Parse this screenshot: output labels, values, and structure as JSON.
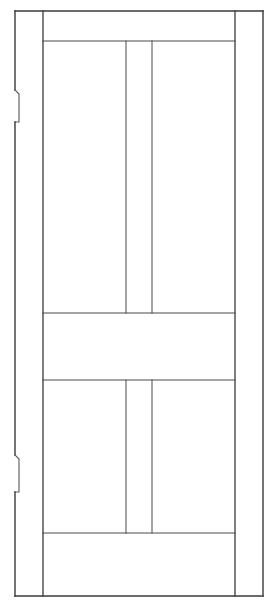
{
  "drawing": {
    "type": "door-elevation",
    "title": "Four Panel Door Elevation",
    "canvas": {
      "width": 276,
      "height": 608,
      "background": "#ffffff"
    },
    "style": {
      "line_color": "#3a3a3a",
      "line_color_light": "#5a5a5a",
      "outline_width": 1.4,
      "inner_width": 1.1,
      "muntin_width": 1.0
    },
    "geometry": {
      "outline": {
        "left": 15,
        "top": 11,
        "right": 263,
        "bottom": 596
      },
      "stiles": {
        "left_inner_x": 43,
        "right_inner_x": 235
      },
      "rails": {
        "top_rail_bottom_y": 41,
        "mid_rail_top_y": 313,
        "mid_rail_bottom_y": 380,
        "bottom_rail_top_y": 533
      },
      "muntins": {
        "x1": 126,
        "x2": 152
      },
      "hinge_notches": [
        {
          "name": "upper-hinge-mortise",
          "top_y": 90,
          "bottom_y": 122,
          "depth_x": 10,
          "inner_x": 19
        },
        {
          "name": "lower-hinge-mortise",
          "top_y": 455,
          "bottom_y": 492,
          "depth_x": 10,
          "inner_x": 19
        }
      ]
    },
    "panels": [
      {
        "name": "upper-left-panel",
        "x": 43,
        "y": 41,
        "width": 83,
        "height": 272
      },
      {
        "name": "upper-center-panel",
        "x": 126,
        "y": 41,
        "width": 26,
        "height": 272
      },
      {
        "name": "upper-right-panel",
        "x": 152,
        "y": 41,
        "width": 83,
        "height": 272
      },
      {
        "name": "middle-rail-panel",
        "x": 43,
        "y": 313,
        "width": 192,
        "height": 67
      },
      {
        "name": "lower-left-panel",
        "x": 43,
        "y": 380,
        "width": 83,
        "height": 153
      },
      {
        "name": "lower-center-panel",
        "x": 126,
        "y": 380,
        "width": 26,
        "height": 153
      },
      {
        "name": "lower-right-panel",
        "x": 152,
        "y": 380,
        "width": 83,
        "height": 153
      },
      {
        "name": "bottom-rail-panel",
        "x": 43,
        "y": 533,
        "width": 192,
        "height": 63
      }
    ]
  }
}
